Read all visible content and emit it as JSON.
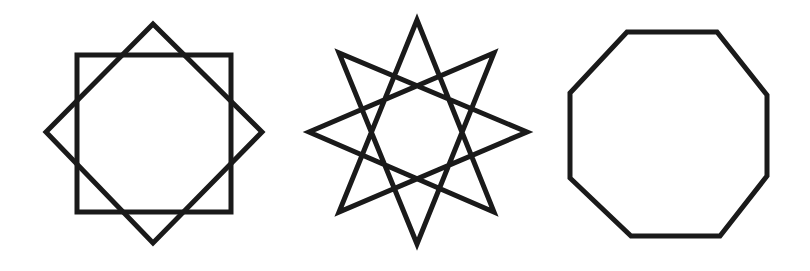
{
  "figure": {
    "title": "Eight-sided figures",
    "background": "#ffffff",
    "stroke_color": "#1a1a1a",
    "stroke_width": 5,
    "shapes": [
      {
        "name": "octagram {8/2} (two overlapping squares)",
        "center": [
          154,
          133
        ],
        "polygons": [
          "77,55 231,55 231,212 77,212",
          "153,24 262,132 153,243 46,132"
        ]
      },
      {
        "name": "octagram {8/3} star",
        "center": [
          417,
          133
        ],
        "polygons": [
          "417,20 494,212 309,132 494,53 417,244 339,53 527,132 339,212"
        ]
      },
      {
        "name": "regular octagon",
        "center": [
          668,
          134
        ],
        "polygons": [
          "627,32 717,32 767,95 767,176 720,236 631,236 570,178 570,93"
        ]
      }
    ]
  }
}
